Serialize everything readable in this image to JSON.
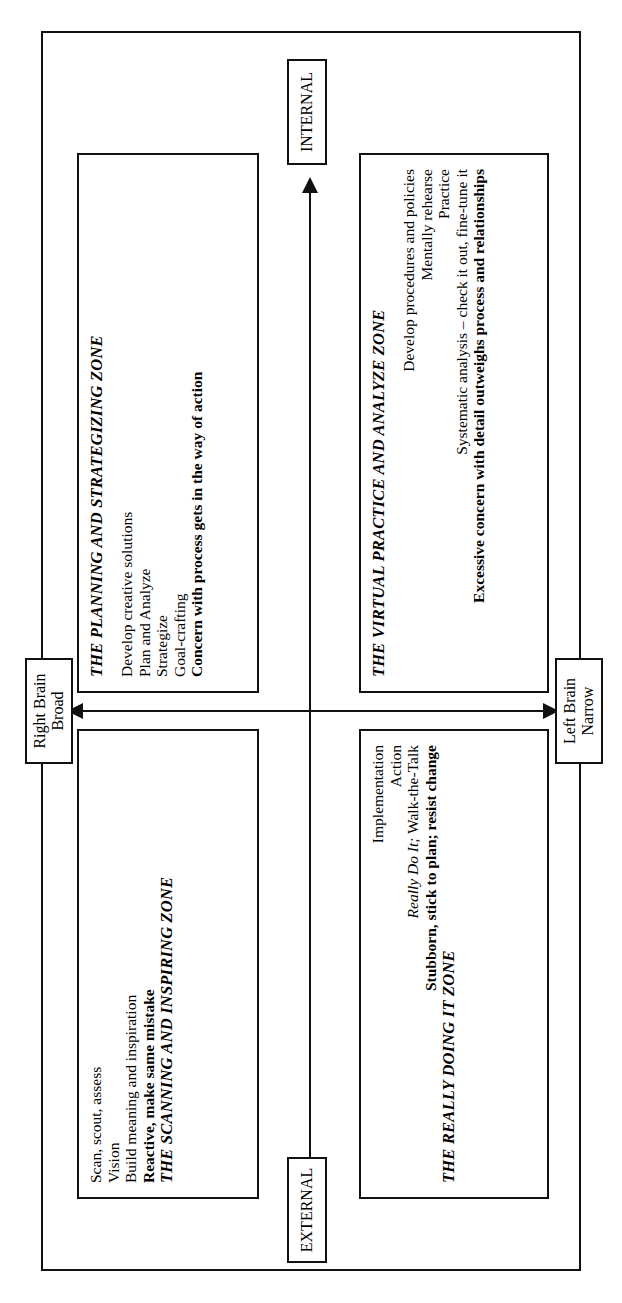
{
  "figure": {
    "orientation": "rotated-90-ccw",
    "axes": {
      "horizontal_left_label": "EXTERNAL",
      "horizontal_right_label": "INTERNAL",
      "vertical_top_label": "Right Brain\nBroad",
      "vertical_top_line1": "Right Brain",
      "vertical_top_line2": "Broad",
      "vertical_bottom_line1": "Left Brain",
      "vertical_bottom_line2": "Narrow"
    },
    "quadrants": [
      {
        "id": "scanning",
        "title": "THE SCANNING AND INSPIRING ZONE",
        "align": "left",
        "items": [
          {
            "text": "Scan, scout, assess",
            "style": "normal"
          },
          {
            "text": "Vision",
            "style": "normal"
          },
          {
            "text": "Build meaning and inspiration",
            "style": "normal"
          },
          {
            "text": "Reactive, make same mistake",
            "style": "bold"
          }
        ]
      },
      {
        "id": "planning",
        "title": "THE PLANNING AND STRATEGIZING ZONE",
        "align": "left",
        "items": [
          {
            "text": "Develop creative solutions",
            "style": "normal"
          },
          {
            "text": "Plan and Analyze",
            "style": "normal"
          },
          {
            "text": "Strategize",
            "style": "normal"
          },
          {
            "text": "Goal-crafting",
            "style": "normal"
          },
          {
            "text": "Concern with process gets in the way of action",
            "style": "bold"
          }
        ]
      },
      {
        "id": "doing",
        "title": "THE REALLY DOING IT ZONE",
        "align": "right",
        "items": [
          {
            "text": "Implementation",
            "style": "normal"
          },
          {
            "text": "Action",
            "style": "normal"
          },
          {
            "text": "Really Do It; Walk-the-Talk",
            "style": "italic-partial",
            "italic_part": "Really Do It;",
            "roman_part": " Walk-the-Talk"
          },
          {
            "text": "Stubborn, stick to plan; resist change",
            "style": "bold"
          }
        ]
      },
      {
        "id": "virtual",
        "title": "THE VIRTUAL PRACTICE AND ANALYZE ZONE",
        "align": "right",
        "items": [
          {
            "text": "Develop procedures and policies",
            "style": "normal"
          },
          {
            "text": "Mentally rehearse",
            "style": "normal"
          },
          {
            "text": "Practice",
            "style": "normal"
          },
          {
            "text": "Systematic analysis – check it out, fine-tune it",
            "style": "normal"
          },
          {
            "text": "Excessive concern with detail outweighs process and relationships",
            "style": "bold"
          }
        ]
      }
    ]
  }
}
